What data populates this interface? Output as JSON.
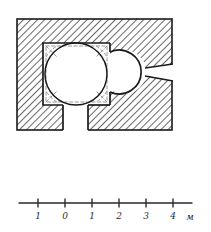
{
  "figure": {
    "type": "architectural-floor-plan",
    "title": "",
    "background_color": "#ffffff",
    "ink_color": "#1a1a1a",
    "hatch_color": "#3a3a3a",
    "dashed_color": "#8a8a8a",
    "interior_fill": "#ffffff"
  },
  "plan": {
    "outer_wall": {
      "label": "hatched masonry wall block",
      "x": 17,
      "y": 19,
      "width": 155,
      "height": 111
    },
    "main_chamber": {
      "label": "square domed chamber",
      "x": 43,
      "y": 43,
      "width": 67,
      "height": 62
    },
    "dome_circle": {
      "label": "dome projection",
      "cx": 76,
      "cy": 74,
      "r": 31
    },
    "apse": {
      "label": "apse",
      "cx": 124,
      "cy": 72,
      "r": 22
    },
    "corridor": {
      "label": "south corridor",
      "x": 63,
      "y": 105,
      "width": 25,
      "height": 25
    },
    "window_slit": {
      "label": "splayed window embrasure",
      "inner_y": 70,
      "outer_y": 74
    },
    "squinches": {
      "label": "corner squinches (dashed)",
      "count": 4
    }
  },
  "scale_bar": {
    "label": "scale bar",
    "unit": "м",
    "ticks": [
      {
        "label": "1",
        "value": -1,
        "x": 38
      },
      {
        "label": "0",
        "value": 0,
        "x": 65
      },
      {
        "label": "1",
        "value": 1,
        "x": 92
      },
      {
        "label": "2",
        "value": 2,
        "x": 119
      },
      {
        "label": "3",
        "value": 3,
        "x": 146
      },
      {
        "label": "4",
        "value": 4,
        "x": 173
      }
    ],
    "axis": {
      "x1": 19,
      "x2": 192,
      "y": 203
    },
    "tick_height": 7,
    "label_y": 219,
    "unit_x": 190
  }
}
